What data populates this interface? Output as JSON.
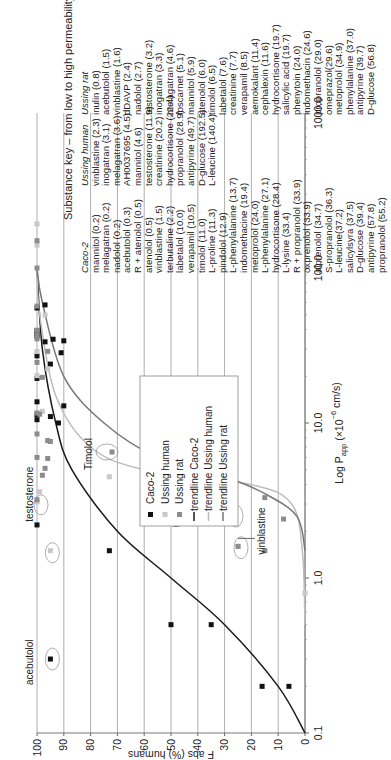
{
  "chart_data": {
    "type": "scatter",
    "title": "",
    "xlabel": "Log P_app (×10^-6 cm/s)",
    "ylabel": "F abs (%) humans",
    "xscale": "log",
    "xlim": [
      0.1,
      1000.0
    ],
    "ylim": [
      0,
      100
    ],
    "x_ticks": [
      "0.1",
      "1.0",
      "10.0",
      "100.0",
      "1000.0"
    ],
    "y_ticks": [
      "0",
      "10",
      "20",
      "30",
      "40",
      "50",
      "60",
      "70",
      "80",
      "90",
      "100"
    ],
    "grid": "horizontal",
    "legend_position": "center-right (inside plot)",
    "legend": [
      "Caco-2",
      "Ussing human",
      "Ussing rat",
      "trendline Caco-2",
      "trendline Ussing human",
      "trendline Ussing rat"
    ],
    "series": [
      {
        "name": "Caco-2",
        "marker": "square",
        "color": "#111111",
        "points": [
          [
            0.2,
            16
          ],
          [
            0.2,
            6
          ],
          [
            0.3,
            95
          ],
          [
            0.5,
            50
          ],
          [
            0.5,
            35
          ],
          [
            1.5,
            73
          ],
          [
            2.2,
            100
          ],
          [
            10.0,
            92
          ],
          [
            10.5,
            100
          ],
          [
            11.0,
            95
          ],
          [
            11.3,
            100
          ],
          [
            12.9,
            90
          ],
          [
            13.7,
            100
          ],
          [
            19.4,
            100
          ],
          [
            24.0,
            95
          ],
          [
            27.1,
            100
          ],
          [
            28.4,
            91
          ],
          [
            33.4,
            97
          ],
          [
            33.9,
            90
          ],
          [
            34.7,
            94
          ],
          [
            36.3,
            100
          ],
          [
            37.2,
            100
          ],
          [
            39.4,
            100
          ],
          [
            57.8,
            97
          ],
          [
            55.2,
            100
          ]
        ]
      },
      {
        "name": "Ussing human",
        "marker": "square",
        "color": "#c8c8c8",
        "points": [
          [
            2.3,
            35
          ],
          [
            3.1,
            100
          ],
          [
            3.6,
            99
          ],
          [
            4.5,
            73
          ],
          [
            4.6,
            50
          ],
          [
            11.9,
            98
          ],
          [
            20.2,
            100
          ],
          [
            22.4,
            96
          ],
          [
            28.9,
            100
          ],
          [
            49.7,
            97
          ],
          [
            140.4,
            100
          ],
          [
            192.5,
            100
          ],
          [
            0.8,
            0
          ],
          [
            1.5,
            95
          ],
          [
            1.6,
            25
          ]
        ]
      },
      {
        "name": "Ussing rat",
        "marker": "square",
        "color": "#8c8c8c",
        "points": [
          [
            1.5,
            15
          ],
          [
            1.6,
            25
          ],
          [
            2.4,
            8
          ],
          [
            2.7,
            45
          ],
          [
            3.2,
            100
          ],
          [
            3.3,
            15
          ],
          [
            4.6,
            98
          ],
          [
            5.1,
            97
          ],
          [
            5.9,
            96
          ],
          [
            6.0,
            100
          ],
          [
            6.5,
            72
          ],
          [
            7.6,
            95
          ],
          [
            7.7,
            96
          ],
          [
            8.5,
            100
          ],
          [
            11.4,
            99
          ],
          [
            11.6,
            100
          ],
          [
            19.7,
            98
          ],
          [
            24.6,
            100
          ],
          [
            29.0,
            96
          ],
          [
            34.9,
            100
          ],
          [
            37.0,
            100
          ],
          [
            39.7,
            100
          ],
          [
            56.8,
            100
          ],
          [
            100,
            100
          ],
          [
            150,
            100
          ]
        ]
      }
    ],
    "trendlines": [
      {
        "name": "trendline Caco-2",
        "color": "#1a1a1a",
        "shape": "sigmoid",
        "points": [
          [
            0.1,
            0
          ],
          [
            0.2,
            10
          ],
          [
            0.5,
            30
          ],
          [
            1.0,
            50
          ],
          [
            2.0,
            70
          ],
          [
            5.0,
            87
          ],
          [
            10.0,
            93
          ],
          [
            30.0,
            98
          ],
          [
            100.0,
            100
          ]
        ]
      },
      {
        "name": "trendline Ussing human",
        "color": "#bdbdbd",
        "shape": "sigmoid",
        "points": [
          [
            0.5,
            0
          ],
          [
            1.5,
            1
          ],
          [
            3.0,
            5
          ],
          [
            4.0,
            20
          ],
          [
            5.0,
            60
          ],
          [
            7.0,
            80
          ],
          [
            15.0,
            93
          ],
          [
            50.0,
            99
          ],
          [
            100.0,
            100
          ]
        ]
      },
      {
        "name": "trendline Ussing rat",
        "color": "#777777",
        "shape": "sigmoid",
        "points": [
          [
            1.5,
            0
          ],
          [
            2.5,
            3
          ],
          [
            3.5,
            15
          ],
          [
            4.5,
            30
          ],
          [
            6.0,
            55
          ],
          [
            10.0,
            75
          ],
          [
            20.0,
            90
          ],
          [
            60.0,
            98
          ],
          [
            100.0,
            100
          ]
        ]
      }
    ],
    "annotations": [
      "acebutolol",
      "testosterone",
      "nadolol",
      "Timolol",
      "vinblastine"
    ]
  },
  "labels": {
    "y_axis_title": "F abs (%) humans",
    "x_axis_title_main": "Log P",
    "x_axis_title_sub": "app",
    "x_axis_title_rest": " (×10",
    "x_axis_title_exp": "−6",
    "x_axis_title_end": " cm/s)",
    "annotations": {
      "acebutolol": "acebutolol",
      "testosterone": "testosterone",
      "nadolol": "nadolol",
      "timolol": "Timolol",
      "vinblastine": "vinblastine"
    },
    "legend": {
      "caco2": "Caco-2",
      "ussing_human": "Ussing human",
      "ussing_rat": "Ussing rat",
      "trend_caco2": "trendline Caco-2",
      "trend_human": "trendline Ussing human",
      "trend_rat": "trendline Ussing rat"
    },
    "x_ticks": [
      "0.1",
      "1.0",
      "10.0",
      "100.0",
      "1000.0"
    ],
    "y_ticks": [
      "100",
      "90",
      "80",
      "70",
      "60",
      "50",
      "40",
      "30",
      "20",
      "10",
      "0"
    ]
  },
  "substance_key": {
    "title": "Substance key – from low to high permeability",
    "columns": [
      {
        "heading": "Caco-2",
        "items": [
          "mannitol (0.2)",
          "melagatran (0.2)",
          "nadolol (0.2)",
          "acebutolol (0.3)",
          "R + atenolol (0.5)",
          "atenolol (0.5)",
          "vinblastine (1.5)",
          "terbutaline (2.2)",
          "labetalol (10.0)",
          "verapamil (10.5)",
          "timolol (11.0)",
          "L-proline (11.3)",
          "pindolol (12.9)",
          "L-phenylalanine (13.7)",
          "indomethacine (19.4)",
          "metoprolol (24.0)",
          "L-phenylalanine (27.1)",
          "hydrocortisone (28.4)",
          "L-lysine (33.4)",
          "R + propranolol (33.9)",
          "oxprenolol (33.9)",
          "alprenolol (34.7)",
          "S-propranolol (36.3)",
          "L-leucine(37.2)",
          "salicylsyra (37.5)",
          "D-glucose (39.4)",
          "antipyrine (57.8)",
          "propranolol (55.2)"
        ]
      },
      {
        "heading": "Ussing human",
        "items": [
          "vinblastine (2.3)",
          "inogatran (3.1)",
          "melagatran (3.6)",
          "AH0037695 (4.5)",
          "mannitol (4.6)",
          "testosterone (11.9)",
          "creatinine (20.2)",
          "hydrocortisone (22.4)",
          "propranolol (28.9)",
          "antipyrine (49.7)",
          "D-glucose (192.5)",
          "L-leucine (140.4)"
        ]
      },
      {
        "heading": "Ussing rat",
        "items": [
          "inulin (0.8)",
          "acebutolol (1.5)",
          "vinblastine (1.6)",
          "dDAVP (2.4)",
          "nadolol (2.7)",
          "testosterone (3.2)",
          "inogatran (3.3)",
          "melagatran (4.6)",
          "foscarnet (5.1)",
          "mannitol (5.9)",
          "atenolol (6.0)",
          "timolol (6.5)",
          "labetalol (7.6)",
          "creatinine (7.7)",
          "verapamil (8.5)",
          "aemokalant (11.4)",
          "cephalexin (11.6)",
          "hydrocortisone (19.7)",
          "salicylic acid (19.7)",
          "phenytoin (24.0)",
          "indomethacin (24.6)",
          "propranolol (29.0)",
          "omeprazol(29.6)",
          "metoprolol (34.9)",
          "phenylalanine (37.0)",
          "antipyrine (39.7)",
          "D-glucose (56.8)"
        ]
      }
    ]
  }
}
